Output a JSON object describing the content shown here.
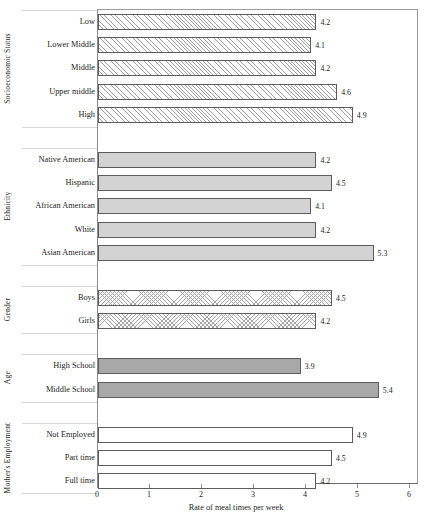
{
  "chart_data": {
    "type": "bar",
    "orientation": "horizontal",
    "title": "",
    "xlabel": "Rate of meal times per week",
    "ylabel": "",
    "xlim": [
      0,
      6
    ],
    "xticks": [
      0,
      1,
      2,
      3,
      4,
      5,
      6
    ],
    "grid": false,
    "legend": "none",
    "groups": [
      {
        "name": "Socioeconomic Status",
        "fill": "hatch",
        "categories": [
          "Low",
          "Lower Middle",
          "Middle",
          "Upper middle",
          "High"
        ],
        "values": [
          4.2,
          4.1,
          4.2,
          4.6,
          4.9
        ],
        "labels": [
          "4.2",
          "4.1",
          "4.2",
          "4.6",
          "4.9"
        ]
      },
      {
        "name": "Ethnicity",
        "fill": "lightgray",
        "categories": [
          "Native American",
          "Hispanic",
          "African American",
          "White",
          "Asian American"
        ],
        "values": [
          4.2,
          4.5,
          4.1,
          4.2,
          5.3
        ],
        "labels": [
          "4.2",
          "4.5",
          "4.1",
          "4.2",
          "5.3"
        ]
      },
      {
        "name": "Gender",
        "fill": "crosshatch",
        "categories": [
          "Boys",
          "Girls"
        ],
        "values": [
          4.5,
          4.2
        ],
        "labels": [
          "4.5",
          "4.2"
        ]
      },
      {
        "name": "Age",
        "fill": "darkgray",
        "categories": [
          "High School",
          "Middle School"
        ],
        "values": [
          3.9,
          5.4
        ],
        "labels": [
          "3.9",
          "5.4"
        ]
      },
      {
        "name": "Mother's Employment",
        "fill": "white",
        "categories": [
          "Not Employed",
          "Part time",
          "Full time"
        ],
        "values": [
          4.9,
          4.5,
          4.2
        ],
        "labels": [
          "4.9",
          "4.5",
          "4.2"
        ]
      }
    ]
  },
  "colors": {
    "bar_border": "#5c5c5c",
    "axis": "#8f8f8f",
    "text": "#1d1d1d",
    "light_gray_fill": "#d3d3d3",
    "dark_gray_fill": "#a8a8a8"
  }
}
